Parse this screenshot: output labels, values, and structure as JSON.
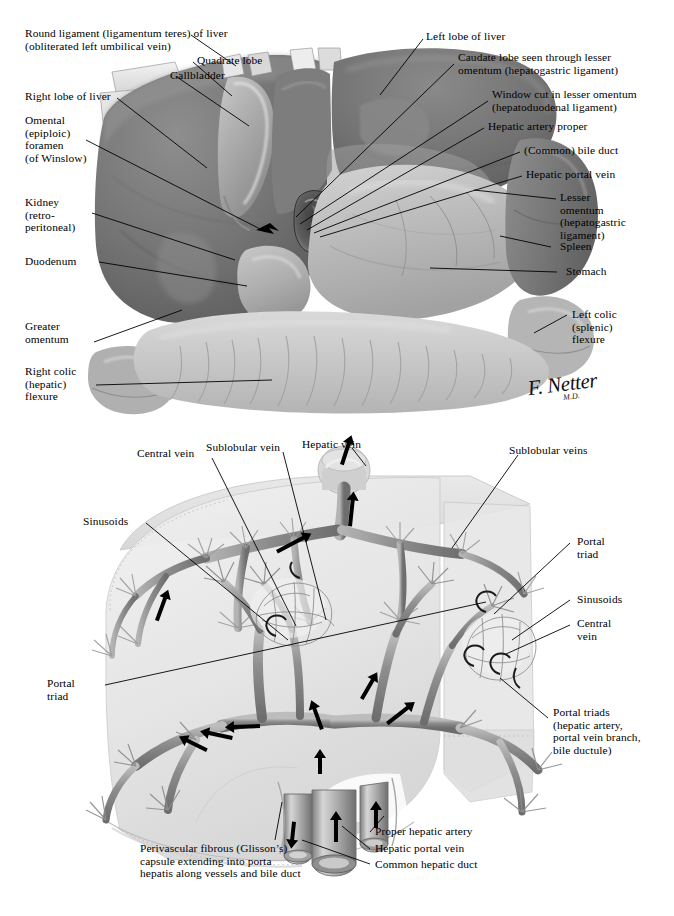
{
  "plate": {
    "signature": "F. Netter",
    "signature_suffix": "M.D.",
    "colors": {
      "ink": "#000000",
      "paper": "#ffffff",
      "liver_dark": "#6e6e6e",
      "liver_mid": "#8d8d8d",
      "stomach_light": "#b9b9b9",
      "omentum": "#d0d0d0",
      "vessel_mid": "#9a9a9a",
      "vessel_dark": "#6a6a6a",
      "capsule": "#e2e2e2"
    }
  },
  "top_panel": {
    "name": "gross-abdominal-viscera-view",
    "labels": [
      {
        "id": "round-ligament",
        "text": "Round ligament (ligamentum teres) of liver\n(obliterated left umbilical vein)"
      },
      {
        "id": "quadrate-lobe",
        "text": "Quadrate lobe"
      },
      {
        "id": "gallbladder",
        "text": "Gallbladder"
      },
      {
        "id": "right-lobe",
        "text": "Right lobe of liver"
      },
      {
        "id": "omental-foramen",
        "text": "Omental\n(epiploic)\nforamen\n(of Winslow)"
      },
      {
        "id": "kidney",
        "text": "Kidney\n(retro-\nperitoneal)"
      },
      {
        "id": "duodenum",
        "text": "Duodenum"
      },
      {
        "id": "greater-omentum",
        "text": "Greater\nomentum"
      },
      {
        "id": "right-colic-flexure",
        "text": "Right colic\n(hepatic)\nflexure"
      },
      {
        "id": "left-lobe",
        "text": "Left lobe of liver"
      },
      {
        "id": "caudate-lobe",
        "text": "Caudate lobe seen through lesser\nomentum (hepatogastric ligament)"
      },
      {
        "id": "window-cut",
        "text": "Window cut in lesser omentum\n(hepatoduodenal ligament)"
      },
      {
        "id": "hepatic-artery-proper",
        "text": "Hepatic artery proper"
      },
      {
        "id": "common-bile-duct",
        "text": "(Common) bile duct"
      },
      {
        "id": "hepatic-portal-vein",
        "text": "Hepatic portal vein"
      },
      {
        "id": "lesser-omentum",
        "text": "Lesser\nomentum\n(hepatogastric\nligament)"
      },
      {
        "id": "spleen",
        "text": "Spleen"
      },
      {
        "id": "stomach",
        "text": "Stomach"
      },
      {
        "id": "left-colic-flexure",
        "text": "Left colic\n(splenic)\nflexure"
      }
    ]
  },
  "bottom_panel": {
    "name": "intrahepatic-vascular-architecture",
    "labels": [
      {
        "id": "central-vein-left",
        "text": "Central vein"
      },
      {
        "id": "sublobular-vein",
        "text": "Sublobular vein"
      },
      {
        "id": "hepatic-vein",
        "text": "Hepatic vein"
      },
      {
        "id": "sublobular-veins",
        "text": "Sublobular veins"
      },
      {
        "id": "sinusoids-left",
        "text": "Sinusoids"
      },
      {
        "id": "portal-triad-right",
        "text": "Portal\ntriad"
      },
      {
        "id": "sinusoids-right",
        "text": "Sinusoids"
      },
      {
        "id": "central-vein-right",
        "text": "Central\nvein"
      },
      {
        "id": "portal-triad-left",
        "text": "Portal\ntriad"
      },
      {
        "id": "portal-triads",
        "text": "Portal triads\n(hepatic artery,\nportal vein branch,\nbile ductule)"
      },
      {
        "id": "proper-hepatic-artery",
        "text": "Proper hepatic artery"
      },
      {
        "id": "hepatic-portal-vein-2",
        "text": "Hepatic portal vein"
      },
      {
        "id": "common-hepatic-duct",
        "text": "Common hepatic duct"
      },
      {
        "id": "glissons-capsule",
        "text": "Perivascular fibrous (Glisson’s)\ncapsule extending into porta\nhepatis along vessels and bile duct"
      }
    ]
  }
}
